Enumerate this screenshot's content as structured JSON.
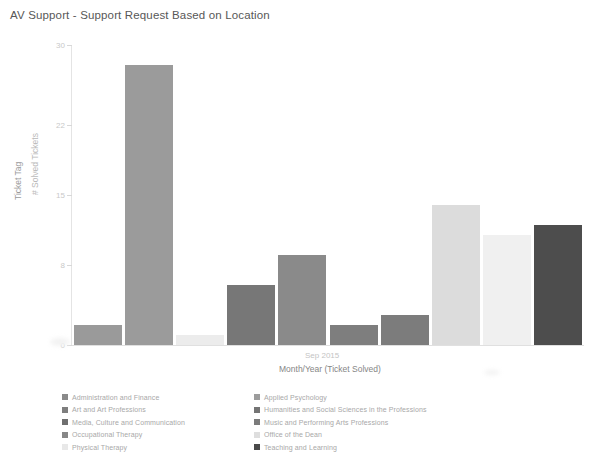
{
  "title": "AV Support - Support Request Based on Location",
  "axes": {
    "y_title": "# Solved Tickets",
    "y_outer_title": "Ticket Tag",
    "x_title": "Month/Year (Ticket Solved)",
    "x_tick": "Sep 2015"
  },
  "legend": {
    "left": [
      {
        "label": "Administration and Finance",
        "color": "#8a8a8a"
      },
      {
        "label": "Art and Art Professions",
        "color": "#7e7e7e"
      },
      {
        "label": "Media, Culture and Communication",
        "color": "#6f6f6f"
      },
      {
        "label": "Occupational Therapy",
        "color": "#878787"
      },
      {
        "label": "Physical Therapy",
        "color": "#e8e8e8"
      }
    ],
    "right": [
      {
        "label": "Applied Psychology",
        "color": "#9c9c9c"
      },
      {
        "label": "Humanities and Social Sciences in the Professions",
        "color": "#747474"
      },
      {
        "label": "Music and Performing Arts Professions",
        "color": "#7b7b7b"
      },
      {
        "label": "Office of the Dean",
        "color": "#dedede"
      },
      {
        "label": "Teaching and Learning",
        "color": "#4a4a4a"
      }
    ]
  },
  "chart_data": {
    "type": "bar",
    "title": "AV Support - Support Request Based on Location",
    "xlabel": "Month/Year (Ticket Solved)",
    "ylabel": "# Solved Tickets",
    "ylim": [
      0,
      30
    ],
    "yticks": [
      0,
      8,
      15,
      22,
      30
    ],
    "ytick_labels": [
      "0",
      "8",
      "15",
      "22",
      "30"
    ],
    "x_categories": [
      "Sep 2015"
    ],
    "grid": false,
    "legend_position": "bottom",
    "categories": [
      "Administration and Finance",
      "Art and Art Professions",
      "Applied Psychology",
      "Humanities and Social Sciences in the Professions",
      "Media, Culture and Communication",
      "Music and Performing Arts Professions",
      "Occupational Therapy",
      "Office of the Dean",
      "Physical Therapy",
      "Teaching and Learning"
    ],
    "values": [
      2,
      28,
      1,
      6,
      9,
      2,
      3,
      14,
      11,
      12
    ],
    "colors": [
      "#9a9a9a",
      "#9b9b9b",
      "#ececec",
      "#777777",
      "#8a8a8a",
      "#7e7e7e",
      "#7c7c7c",
      "#dcdcdc",
      "#f0f0f0",
      "#4d4d4d"
    ]
  }
}
